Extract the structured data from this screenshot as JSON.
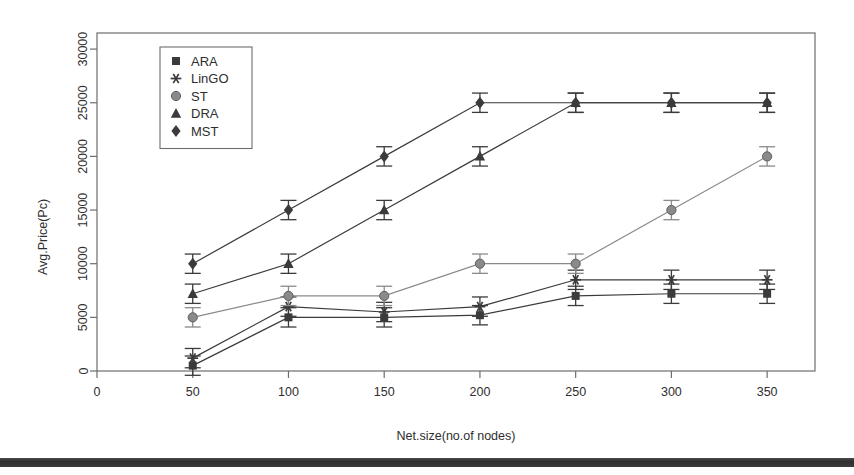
{
  "chart_data": {
    "type": "line",
    "title": "",
    "xlabel": "Net.size(no.of nodes)",
    "ylabel": "Avg.Price(Pc)",
    "x": [
      50,
      100,
      150,
      200,
      250,
      300,
      350
    ],
    "xlim": [
      0,
      375
    ],
    "ylim": [
      0,
      31500
    ],
    "xticks": [
      0,
      50,
      100,
      150,
      200,
      250,
      300,
      350
    ],
    "xtick_labels": [
      "0",
      "50",
      "100",
      "150",
      "200",
      "250",
      "300",
      "350"
    ],
    "yticks": [
      0,
      5000,
      10000,
      15000,
      20000,
      25000,
      30000
    ],
    "ytick_labels": [
      "0",
      "5000",
      "10000",
      "15000",
      "20000",
      "25000",
      "30000"
    ],
    "grid": false,
    "legend_position": "top-left",
    "error_bars": true,
    "series": [
      {
        "name": "ARA",
        "marker": "square",
        "color": "#3b3b3b",
        "values": [
          500,
          5000,
          5000,
          5200,
          7000,
          7200,
          7200
        ],
        "errors": [
          900,
          900,
          900,
          900,
          900,
          900,
          900
        ]
      },
      {
        "name": "LinGO",
        "marker": "asterisk",
        "color": "#3b3b3b",
        "values": [
          1200,
          6000,
          5500,
          6000,
          8500,
          8500,
          8500
        ],
        "errors": [
          900,
          900,
          900,
          900,
          900,
          900,
          900
        ]
      },
      {
        "name": "ST",
        "marker": "circle",
        "color": "#8a8a8a",
        "values": [
          5000,
          7000,
          7000,
          10000,
          10000,
          15000,
          20000
        ],
        "errors": [
          900,
          900,
          900,
          900,
          900,
          900,
          900
        ]
      },
      {
        "name": "DRA",
        "marker": "triangle",
        "color": "#3b3b3b",
        "values": [
          7200,
          10000,
          15000,
          20000,
          25000,
          25000,
          25000
        ],
        "errors": [
          900,
          900,
          900,
          900,
          900,
          900,
          900
        ]
      },
      {
        "name": "MST",
        "marker": "diamond",
        "color": "#3b3b3b",
        "values": [
          10000,
          15000,
          20000,
          25000,
          25000,
          25000,
          25000
        ],
        "errors": [
          900,
          900,
          900,
          900,
          900,
          900,
          900
        ]
      }
    ]
  }
}
